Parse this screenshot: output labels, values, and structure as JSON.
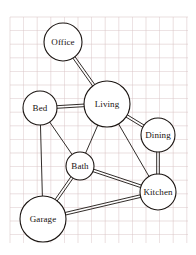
{
  "diagram": {
    "background": "#ffffff",
    "paper": {
      "name": "grid-paper",
      "grid_color": "#d8c3c4",
      "grid_minor_color": "#e8dadb",
      "grid_spacing_px": 13.6,
      "area": {
        "x": 10,
        "y": 17,
        "width": 178,
        "height": 226
      }
    },
    "style": {
      "stroke_color": "#1b1512",
      "node_fill": "#ffffff",
      "node_stroke_width": 1.1,
      "edge_stroke_width": 0.9,
      "edge_double_gap_px": 2.6,
      "label_color": "#17120f"
    },
    "nodes": [
      {
        "id": "office",
        "label": "Office",
        "cx": 63,
        "cy": 42,
        "r": 19
      },
      {
        "id": "living",
        "label": "Living",
        "cx": 107,
        "cy": 104,
        "r": 23
      },
      {
        "id": "bed",
        "label": "Bed",
        "cx": 40,
        "cy": 108,
        "r": 17
      },
      {
        "id": "dining",
        "label": "Dining",
        "cx": 158,
        "cy": 135,
        "r": 17
      },
      {
        "id": "bath",
        "label": "Bath",
        "cx": 80,
        "cy": 166,
        "r": 14
      },
      {
        "id": "kitchen",
        "label": "Kitchen",
        "cx": 158,
        "cy": 192,
        "r": 18
      },
      {
        "id": "garage",
        "label": "Garage",
        "cx": 43,
        "cy": 219,
        "r": 23
      }
    ],
    "edges": [
      {
        "from": "office",
        "to": "living",
        "type": "double"
      },
      {
        "from": "bed",
        "to": "living",
        "type": "double"
      },
      {
        "from": "living",
        "to": "dining",
        "type": "double"
      },
      {
        "from": "dining",
        "to": "kitchen",
        "type": "double"
      },
      {
        "from": "bath",
        "to": "kitchen",
        "type": "double"
      },
      {
        "from": "bath",
        "to": "garage",
        "type": "double"
      },
      {
        "from": "garage",
        "to": "kitchen",
        "type": "double"
      },
      {
        "from": "bed",
        "to": "bath",
        "type": "single"
      },
      {
        "from": "bed",
        "to": "garage",
        "type": "single"
      },
      {
        "from": "living",
        "to": "bath",
        "type": "single"
      },
      {
        "from": "living",
        "to": "kitchen",
        "type": "single"
      }
    ]
  }
}
